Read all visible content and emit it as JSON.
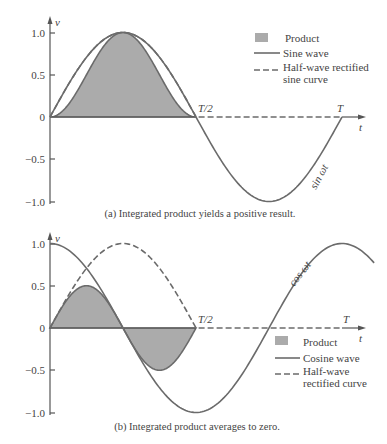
{
  "chart_data": [
    {
      "type": "area",
      "panel": "a",
      "caption": "(a) Integrated product yields a positive result.",
      "ylabel": "v",
      "xlabel": "t",
      "ylim": [
        -1.0,
        1.0
      ],
      "yticks": [
        "1.0",
        "0.5",
        "0",
        "−0.5",
        "−1.0"
      ],
      "xticks": [
        "T/2",
        "T"
      ],
      "curve_annotation": "sin ωt",
      "legend": [
        "Product",
        "Sine wave",
        "Half-wave rectified sine curve"
      ],
      "series": [
        {
          "name": "Sine wave",
          "expr": "sin(2πt/T)",
          "x": [
            0,
            0.125,
            0.25,
            0.375,
            0.5,
            0.625,
            0.75,
            0.875,
            1.0
          ],
          "values": [
            0,
            0.707,
            1.0,
            0.707,
            0,
            -0.707,
            -1.0,
            -0.707,
            0
          ]
        },
        {
          "name": "Half-wave rectified sine curve",
          "x": [
            0,
            0.125,
            0.25,
            0.375,
            0.5,
            0.625,
            0.75,
            0.875,
            1.0
          ],
          "values": [
            0,
            0.707,
            1.0,
            0.707,
            0,
            0,
            0,
            0,
            0
          ]
        },
        {
          "name": "Product",
          "x": [
            0,
            0.125,
            0.25,
            0.375,
            0.5,
            0.625,
            0.75,
            0.875,
            1.0
          ],
          "values": [
            0,
            0.5,
            1.0,
            0.5,
            0,
            0,
            0,
            0,
            0
          ]
        }
      ]
    },
    {
      "type": "area",
      "panel": "b",
      "caption": "(b) Integrated product averages to zero.",
      "ylabel": "v",
      "xlabel": "t",
      "ylim": [
        -1.0,
        1.0
      ],
      "yticks": [
        "1.0",
        "0.5",
        "0",
        "−0.5",
        "−1.0"
      ],
      "xticks": [
        "T/2",
        "T"
      ],
      "curve_annotation": "cos ωt",
      "legend": [
        "Product",
        "Cosine wave",
        "Half-wave rectified curve"
      ],
      "series": [
        {
          "name": "Cosine wave",
          "expr": "cos(2πt/T)",
          "x": [
            0,
            0.125,
            0.25,
            0.375,
            0.5,
            0.625,
            0.75,
            0.875,
            1.0
          ],
          "values": [
            1.0,
            0.707,
            0,
            -0.707,
            -1.0,
            -0.707,
            0,
            0.707,
            1.0
          ]
        },
        {
          "name": "Half-wave rectified curve",
          "x": [
            0,
            0.125,
            0.25,
            0.375,
            0.5,
            0.625,
            0.75,
            0.875,
            1.0
          ],
          "values": [
            0,
            0.707,
            1.0,
            0.707,
            0,
            0,
            0,
            0,
            0
          ]
        },
        {
          "name": "Product",
          "x": [
            0,
            0.125,
            0.25,
            0.375,
            0.5,
            0.625,
            0.75,
            0.875,
            1.0
          ],
          "values": [
            0,
            0.5,
            0,
            -0.5,
            0,
            0,
            0,
            0,
            0
          ]
        }
      ]
    }
  ],
  "panels": {
    "a": {
      "caption": "(a) Integrated product yields a positive result.",
      "y_axis_label": "v",
      "x_axis_label": "t",
      "ticks": {
        "p1": "1.0",
        "p05": "0.5",
        "z": "0",
        "m05": "−0.5",
        "m1": "−1.0"
      },
      "x_half": "T/2",
      "x_full": "T",
      "curve_label": "sin ωt",
      "legend": {
        "product": "Product",
        "solid": "Sine wave",
        "dashed_1": "Half-wave rectified",
        "dashed_2": "sine curve"
      }
    },
    "b": {
      "caption": "(b) Integrated product averages to zero.",
      "y_axis_label": "v",
      "x_axis_label": "t",
      "ticks": {
        "p1": "1.0",
        "p05": "0.5",
        "z": "0",
        "m05": "−0.5",
        "m1": "−1.0"
      },
      "x_half": "T/2",
      "x_full": "T",
      "curve_label": "cos ωt",
      "legend": {
        "product": "Product",
        "solid": "Cosine wave",
        "dashed_1": "Half-wave",
        "dashed_2": "rectified curve"
      }
    }
  },
  "colors": {
    "curve": "#6b6b6b",
    "fill": "#ababab",
    "axis": "#555555",
    "text": "#444444"
  }
}
